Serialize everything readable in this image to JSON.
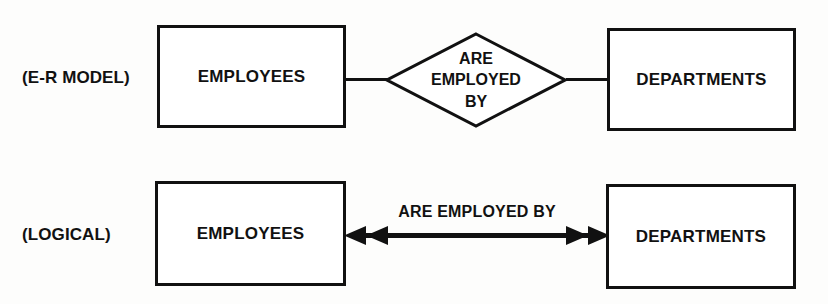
{
  "diagram": {
    "stroke_color": "#111111",
    "background_color": "#fdfdfc",
    "rows": [
      {
        "id": "er",
        "label": "(E-R MODEL)",
        "left_entity": "EMPLOYEES",
        "right_entity": "DEPARTMENTS",
        "relationship_lines": [
          "ARE",
          "EMPLOYED",
          "BY"
        ],
        "relationship_shape": "diamond",
        "connector_style": "plain-line"
      },
      {
        "id": "logical",
        "label": "(LOGICAL)",
        "left_entity": "EMPLOYEES",
        "right_entity": "DEPARTMENTS",
        "relationship_label": "ARE EMPLOYED BY",
        "relationship_shape": "double-headed-arrow",
        "connector_style": "bidirectional-arrow"
      }
    ]
  }
}
